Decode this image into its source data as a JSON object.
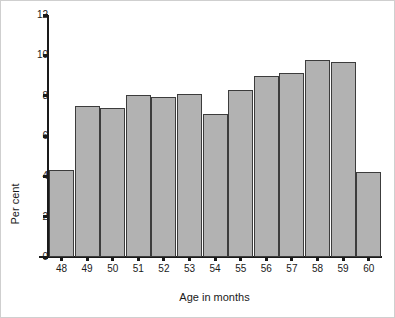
{
  "chart_data": {
    "type": "bar",
    "title": "",
    "subtitle": "",
    "xlabel": "Age in months",
    "ylabel": "Per cent",
    "categories": [
      "48",
      "49",
      "50",
      "51",
      "52",
      "53",
      "54",
      "55",
      "56",
      "57",
      "58",
      "59",
      "60"
    ],
    "values": [
      4.3,
      7.5,
      7.4,
      8.05,
      7.95,
      8.1,
      7.1,
      8.3,
      9.0,
      9.1,
      9.75,
      9.65,
      4.2
    ],
    "series": [
      {
        "name": "Per cent",
        "values": [
          4.3,
          7.5,
          7.4,
          8.05,
          7.95,
          8.1,
          7.1,
          8.3,
          9.0,
          9.1,
          9.75,
          9.65,
          4.2
        ]
      }
    ],
    "ylim": [
      0,
      12
    ],
    "y_ticks": [
      0,
      2,
      4,
      6,
      8,
      10,
      12
    ],
    "y_tick_labels": [
      "0",
      "2",
      "4",
      "6",
      "8",
      "10",
      "12"
    ],
    "x_tick_labels": [
      "48",
      "49",
      "50",
      "51",
      "52",
      "53",
      "54",
      "55",
      "56",
      "57",
      "58",
      "59",
      "60"
    ],
    "grid": false,
    "legend": null,
    "legend_position": "none",
    "annotations": [],
    "colors": {
      "bar_fill": "#b2b2b2",
      "bar_border": "#3c3c3c",
      "axis": "#1a1a1a",
      "background": "#ffffff",
      "frame": "#cfcfcf"
    }
  }
}
